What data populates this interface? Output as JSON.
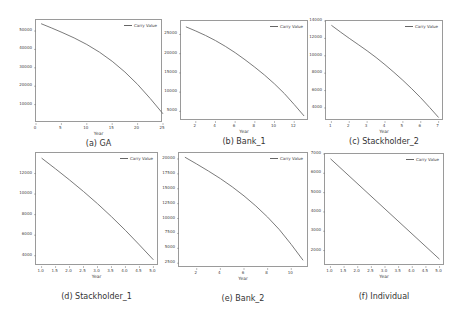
{
  "chart_data": [
    {
      "id": "a",
      "type": "line",
      "caption": "(a) GA",
      "title": "",
      "xlabel": "Year",
      "ylabel": "",
      "legend": [
        "Carry Value"
      ],
      "legend_position": "upper right",
      "grid": false,
      "xlim": [
        0,
        25
      ],
      "ylim": [
        0,
        56000
      ],
      "xticks": [
        "0",
        "5",
        "10",
        "15",
        "20",
        "25"
      ],
      "yticks": [
        "10000",
        "20000",
        "30000",
        "40000",
        "50000"
      ],
      "series": [
        {
          "name": "Carry Value",
          "x": [
            1,
            5,
            10,
            15,
            20,
            25
          ],
          "values": [
            54000,
            49500,
            43000,
            34000,
            21500,
            5000
          ]
        }
      ],
      "frame": {
        "left": 35,
        "top": 19,
        "width": 127,
        "height": 103
      }
    },
    {
      "id": "b",
      "type": "line",
      "caption": "(b) Bank_1",
      "title": "",
      "xlabel": "Year",
      "ylabel": "",
      "legend": [
        "Carry Value"
      ],
      "legend_position": "upper right",
      "grid": false,
      "xlim": [
        0.5,
        13.5
      ],
      "ylim": [
        2500,
        28500
      ],
      "xticks": [
        "2",
        "4",
        "6",
        "8",
        "10",
        "12"
      ],
      "yticks": [
        "5000",
        "10000",
        "15000",
        "20000",
        "25000"
      ],
      "series": [
        {
          "name": "Carry Value",
          "x": [
            1,
            3,
            5,
            7,
            9,
            11,
            13
          ],
          "values": [
            27000,
            24800,
            22000,
            18500,
            14500,
            9800,
            3800
          ]
        }
      ],
      "frame": {
        "left": 180,
        "top": 20,
        "width": 128,
        "height": 100
      }
    },
    {
      "id": "c",
      "type": "line",
      "caption": "(c) Stackholder_2",
      "title": "",
      "xlabel": "Year",
      "ylabel": "",
      "legend": [
        "Carry Value"
      ],
      "legend_position": "upper right",
      "grid": false,
      "xlim": [
        0.7,
        7.3
      ],
      "ylim": [
        2500,
        14000
      ],
      "xticks": [
        "1",
        "2",
        "3",
        "4",
        "5",
        "6",
        "7"
      ],
      "yticks": [
        "4000",
        "6000",
        "8000",
        "10000",
        "12000",
        "14000"
      ],
      "series": [
        {
          "name": "Carry Value",
          "x": [
            1,
            2,
            3,
            4,
            5,
            6,
            7
          ],
          "values": [
            13500,
            12000,
            10600,
            9000,
            7200,
            5200,
            2900
          ]
        }
      ],
      "frame": {
        "left": 325,
        "top": 20,
        "width": 118,
        "height": 100
      }
    },
    {
      "id": "d",
      "type": "line",
      "caption": "(d) Stackholder_1",
      "title": "",
      "xlabel": "Year",
      "ylabel": "",
      "legend": [
        "Carry Value"
      ],
      "legend_position": "upper right",
      "grid": false,
      "xlim": [
        0.8,
        5.2
      ],
      "ylim": [
        3000,
        14000
      ],
      "xticks": [
        "1.0",
        "1.5",
        "2.0",
        "2.5",
        "3.0",
        "3.5",
        "4.0",
        "4.5",
        "5.0"
      ],
      "yticks": [
        "4000",
        "6000",
        "8000",
        "10000",
        "12000"
      ],
      "series": [
        {
          "name": "Carry Value",
          "x": [
            1,
            2,
            3,
            4,
            5
          ],
          "values": [
            13500,
            11400,
            9100,
            6500,
            3600
          ]
        }
      ],
      "frame": {
        "left": 35,
        "top": 152,
        "width": 123,
        "height": 113
      }
    },
    {
      "id": "e",
      "type": "line",
      "caption": "(e) Bank_2",
      "title": "",
      "xlabel": "Year",
      "ylabel": "",
      "legend": [
        "Carry Value"
      ],
      "legend_position": "upper right",
      "grid": false,
      "xlim": [
        0.5,
        11.5
      ],
      "ylim": [
        1700,
        21000
      ],
      "xticks": [
        "2",
        "4",
        "6",
        "8",
        "10"
      ],
      "yticks": [
        "2500",
        "5000",
        "7500",
        "10000",
        "12500",
        "15000",
        "17500",
        "20000"
      ],
      "series": [
        {
          "name": "Carry Value",
          "x": [
            1,
            3,
            5,
            7,
            9,
            11
          ],
          "values": [
            20300,
            18000,
            15400,
            12200,
            8300,
            3000
          ]
        }
      ],
      "frame": {
        "left": 178,
        "top": 152,
        "width": 130,
        "height": 115
      }
    },
    {
      "id": "f",
      "type": "line",
      "caption": "(f) Individual",
      "title": "",
      "xlabel": "Year",
      "ylabel": "",
      "legend": [
        "Carry Value"
      ],
      "legend_position": "upper right",
      "grid": false,
      "xlim": [
        0.8,
        5.2
      ],
      "ylim": [
        1200,
        7000
      ],
      "xticks": [
        "1.0",
        "1.5",
        "2.0",
        "2.5",
        "3.0",
        "3.5",
        "4.0",
        "4.5",
        "5.0"
      ],
      "yticks": [
        "2000",
        "3000",
        "4000",
        "5000",
        "6000",
        "7000"
      ],
      "series": [
        {
          "name": "Carry Value",
          "x": [
            1,
            5
          ],
          "values": [
            6750,
            1550
          ]
        }
      ],
      "frame": {
        "left": 324,
        "top": 153,
        "width": 120,
        "height": 112
      }
    }
  ],
  "colors": {
    "line": "#6b6b6b",
    "frame": "#9a9a9a",
    "text": "#333333"
  }
}
